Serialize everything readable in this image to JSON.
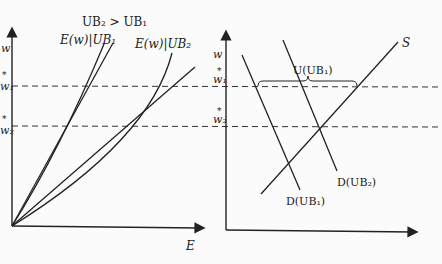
{
  "figure": {
    "header_condition": "UB₂ > UB₁",
    "left_panel": {
      "y_axis_label": "w",
      "x_axis_label": "E",
      "ticks": {
        "w1": "w₁",
        "w1_star": "*",
        "w2": "w₂",
        "w2_star": "*"
      },
      "curves": [
        {
          "id": "E_UB1",
          "label": "E(w)|UB₁"
        },
        {
          "id": "E_UB2",
          "label": "E(w)|UB₂"
        }
      ]
    },
    "right_panel": {
      "y_axis_label": "w",
      "x_axis_label": "N",
      "ticks": {
        "w1": "w₁",
        "w1_star": "*",
        "w2": "w₂",
        "w2_star": "*"
      },
      "supply_label": "S",
      "demand_UB1_label": "D(UB₁)",
      "demand_UB2_label": "D(UB₂)",
      "brace_label": "U(UB₁)"
    },
    "colors": {
      "ink": "#222222",
      "background": "#fbfbfb"
    }
  }
}
